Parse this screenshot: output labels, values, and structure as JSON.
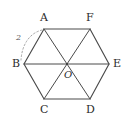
{
  "figure": {
    "background_color": "#ffffff",
    "stroke_color": "#4a4a4a",
    "label_color": "#2b2b2b",
    "dotted_color": "#9a9a9a",
    "shape_type": "regular-hexagon",
    "center": {
      "label": "O",
      "x": 67,
      "y": 64
    },
    "vertices": [
      {
        "label": "A",
        "x": 44,
        "y": 29,
        "label_x": 40,
        "label_y": 12
      },
      {
        "label": "F",
        "x": 90,
        "y": 29,
        "label_x": 86,
        "label_y": 12
      },
      {
        "label": "E",
        "x": 109,
        "y": 64,
        "label_x": 113,
        "label_y": 58
      },
      {
        "label": "D",
        "x": 90,
        "y": 99,
        "label_x": 86,
        "label_y": 104
      },
      {
        "label": "C",
        "x": 44,
        "y": 99,
        "label_x": 40,
        "label_y": 104
      },
      {
        "label": "B",
        "x": 24,
        "y": 64,
        "label_x": 12,
        "label_y": 58
      }
    ],
    "outline_path": "M44,29 L90,29 L109,64 L90,99 L44,99 L24,64 Z",
    "diagonals": [
      {
        "name": "diagonal-AD",
        "from": "A",
        "to": "D"
      },
      {
        "name": "diagonal-FC",
        "from": "F",
        "to": "C"
      },
      {
        "name": "diagonal-BE",
        "from": "B",
        "to": "E"
      }
    ],
    "measure": {
      "label": "2",
      "label_x": 16,
      "label_y": 34,
      "applies_to_side": "AB",
      "arc_path": "M42,30 C30,33 22,44 21,60",
      "dash": "1.6 2.2"
    }
  }
}
